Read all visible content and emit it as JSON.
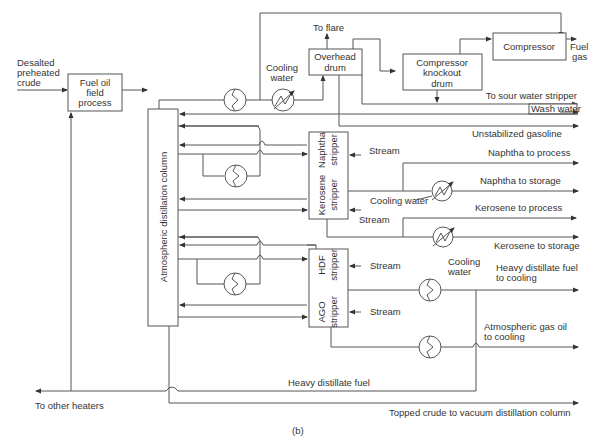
{
  "diagram": {
    "caption": "(b)",
    "equipment": {
      "fuel_oil_field_process": [
        "Fuel oil",
        "field",
        "process"
      ],
      "atmospheric_column": "Atmospheric distillation column",
      "overhead_drum": [
        "Overhead",
        "drum"
      ],
      "compressor_knockout_drum": [
        "Compressor",
        "knockout",
        "drum"
      ],
      "compressor": "Compressor",
      "naphtha_stripper": [
        "Naphtha",
        "stripper"
      ],
      "kerosene_stripper": [
        "Kerosene",
        "stripper"
      ],
      "hdf_stripper": [
        "HDF",
        "stripper"
      ],
      "ago_stripper": [
        "AGO",
        "stripper"
      ]
    },
    "labels": {
      "feed": [
        "Desalted",
        "preheated",
        "crude"
      ],
      "cooling_water_top": [
        "Cooling",
        "water"
      ],
      "to_flare": "To flare",
      "fuel_gas": [
        "Fuel",
        "gas"
      ],
      "to_sour_water_stripper": "To sour water stripper",
      "wash_water": "Wash water",
      "unstabilized_gasoline": "Unstabilized gasoline",
      "stream_naphtha": "Stream",
      "naphtha_to_process": "Naphtha to process",
      "naphtha_to_storage": "Naphtha to storage",
      "cooling_water_mid": "Cooling water",
      "stream_kerosene": "Stream",
      "kerosene_to_process": "Kerosene to process",
      "kerosene_to_storage": "Kerosene to storage",
      "stream_hdf": "Stream",
      "cooling_water_low": [
        "Cooling",
        "water"
      ],
      "heavy_distillate_fuel_to_cooling": [
        "Heavy distillate fuel",
        "to cooling"
      ],
      "stream_ago": "Stream",
      "atmospheric_gas_oil_to_cooling": [
        "Atmospheric gas oil",
        "to cooling"
      ],
      "heavy_distillate_fuel": "Heavy distillate fuel",
      "to_other_heaters": "To other heaters",
      "topped_crude": "Topped crude to vacuum distillation column"
    },
    "colors": {
      "line": "#555555",
      "text": "#333333",
      "background": "#ffffff"
    }
  }
}
